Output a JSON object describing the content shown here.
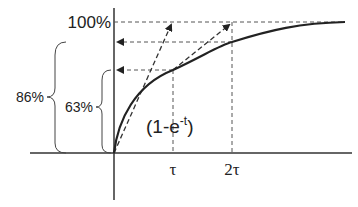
{
  "diagram": {
    "y_labels": {
      "full": "100%",
      "two_tau": "86%",
      "one_tau": "63%"
    },
    "x_labels": {
      "tau": "τ",
      "two_tau": "2τ"
    },
    "curve_label": {
      "prefix": "(1-e",
      "superscript": "-t",
      "suffix": ")"
    },
    "colors": {
      "curve": "#222222",
      "dashed": "#555555",
      "axis": "#333333"
    }
  }
}
